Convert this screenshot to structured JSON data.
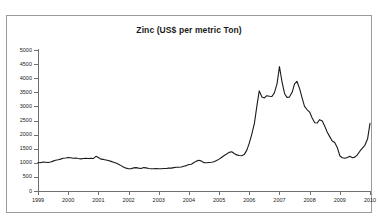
{
  "page": {
    "top_strip_ghost_text": "",
    "background_color": "#ffffff",
    "frame_color": "#9a9a9e"
  },
  "chart_data": {
    "type": "line",
    "title": "Zinc (US$ per metric Ton)",
    "xlabel": "",
    "ylabel": "",
    "ylim": [
      0,
      5000
    ],
    "ytick_step": 500,
    "ytick_labels": [
      "0",
      "500",
      "1000",
      "1500",
      "2000",
      "2500",
      "3000",
      "3500",
      "4000",
      "4500",
      "5000"
    ],
    "ytick_values": [
      0,
      500,
      1000,
      1500,
      2000,
      2500,
      3000,
      3500,
      4000,
      4500,
      5000
    ],
    "xlim": [
      1999,
      2010
    ],
    "xtick_labels": [
      "1999",
      "2000",
      "2001",
      "2002",
      "2003",
      "2004",
      "2005",
      "2006",
      "2007",
      "2008",
      "2009",
      "2010"
    ],
    "xtick_values": [
      1999,
      2000,
      2001,
      2002,
      2003,
      2004,
      2005,
      2006,
      2007,
      2008,
      2009,
      2010
    ],
    "grid": false,
    "legend": false,
    "line_color": "#1a1a1a",
    "series": [
      {
        "name": "Zinc price",
        "x": [
          1999.0,
          1999.08,
          1999.17,
          1999.25,
          1999.33,
          1999.42,
          1999.5,
          1999.58,
          1999.67,
          1999.75,
          1999.83,
          1999.92,
          2000.0,
          2000.08,
          2000.17,
          2000.25,
          2000.33,
          2000.42,
          2000.5,
          2000.58,
          2000.67,
          2000.75,
          2000.83,
          2000.92,
          2001.0,
          2001.08,
          2001.17,
          2001.25,
          2001.33,
          2001.42,
          2001.5,
          2001.58,
          2001.67,
          2001.75,
          2001.83,
          2001.92,
          2002.0,
          2002.08,
          2002.17,
          2002.25,
          2002.33,
          2002.42,
          2002.5,
          2002.58,
          2002.67,
          2002.75,
          2002.83,
          2002.92,
          2003.0,
          2003.08,
          2003.17,
          2003.25,
          2003.33,
          2003.42,
          2003.5,
          2003.58,
          2003.67,
          2003.75,
          2003.83,
          2003.92,
          2004.0,
          2004.08,
          2004.17,
          2004.25,
          2004.33,
          2004.42,
          2004.5,
          2004.58,
          2004.67,
          2004.75,
          2004.83,
          2004.92,
          2005.0,
          2005.08,
          2005.17,
          2005.25,
          2005.33,
          2005.42,
          2005.5,
          2005.58,
          2005.67,
          2005.75,
          2005.83,
          2005.92,
          2006.0,
          2006.08,
          2006.17,
          2006.25,
          2006.33,
          2006.42,
          2006.5,
          2006.58,
          2006.67,
          2006.75,
          2006.83,
          2006.92,
          2007.0,
          2007.08,
          2007.17,
          2007.25,
          2007.33,
          2007.42,
          2007.5,
          2007.58,
          2007.67,
          2007.75,
          2007.83,
          2007.92,
          2008.0,
          2008.08,
          2008.17,
          2008.25,
          2008.33,
          2008.42,
          2008.5,
          2008.58,
          2008.67,
          2008.75,
          2008.83,
          2008.92,
          2009.0,
          2009.08,
          2009.17,
          2009.25,
          2009.33,
          2009.42,
          2009.5,
          2009.58,
          2009.67,
          2009.75,
          2009.83,
          2009.92,
          2010.0
        ],
        "values": [
          1010,
          1000,
          1030,
          1020,
          1010,
          1030,
          1060,
          1090,
          1110,
          1130,
          1160,
          1170,
          1190,
          1180,
          1160,
          1170,
          1150,
          1140,
          1150,
          1160,
          1150,
          1160,
          1150,
          1230,
          1190,
          1130,
          1120,
          1100,
          1080,
          1050,
          1020,
          990,
          950,
          900,
          850,
          810,
          790,
          790,
          820,
          830,
          810,
          800,
          830,
          820,
          800,
          790,
          790,
          800,
          790,
          790,
          800,
          800,
          810,
          810,
          830,
          840,
          840,
          850,
          880,
          900,
          940,
          950,
          1010,
          1060,
          1090,
          1060,
          1000,
          1000,
          1010,
          1020,
          1040,
          1080,
          1130,
          1190,
          1260,
          1310,
          1370,
          1390,
          1330,
          1280,
          1260,
          1250,
          1290,
          1450,
          1700,
          2000,
          2400,
          3000,
          3550,
          3330,
          3300,
          3380,
          3360,
          3350,
          3480,
          3800,
          4410,
          3900,
          3450,
          3320,
          3330,
          3500,
          3800,
          3890,
          3620,
          3300,
          3000,
          2880,
          2800,
          2600,
          2420,
          2410,
          2530,
          2480,
          2300,
          2090,
          1920,
          1770,
          1720,
          1530,
          1250,
          1180,
          1160,
          1190,
          1230,
          1180,
          1200,
          1280,
          1420,
          1520,
          1620,
          1850,
          2400
        ]
      }
    ]
  }
}
